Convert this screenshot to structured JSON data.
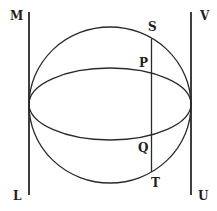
{
  "diagram": {
    "stroke_color": "#2a2a2a",
    "background": "#ffffff",
    "circle": {
      "cx": 110,
      "cy": 105,
      "rx": 81,
      "ry": 78
    },
    "ellipse": {
      "cx": 110,
      "cy": 104,
      "rx": 81,
      "ry": 36
    },
    "left_line": {
      "x": 29,
      "y1": 12,
      "y2": 195
    },
    "right_line": {
      "x": 191,
      "y1": 12,
      "y2": 195
    },
    "chord": {
      "x": 151.5,
      "y1": 39,
      "y2": 172
    },
    "labels": {
      "M": {
        "text": "M",
        "x": 10,
        "y": 20
      },
      "L": {
        "text": "L",
        "x": 13,
        "y": 200
      },
      "V": {
        "text": "V",
        "x": 200,
        "y": 20
      },
      "U": {
        "text": "U",
        "x": 198,
        "y": 200
      },
      "S": {
        "text": "S",
        "x": 148,
        "y": 31
      },
      "P": {
        "text": "P",
        "x": 139,
        "y": 67
      },
      "Q": {
        "text": "Q",
        "x": 138,
        "y": 152
      },
      "T": {
        "text": "T",
        "x": 151,
        "y": 187
      }
    }
  }
}
